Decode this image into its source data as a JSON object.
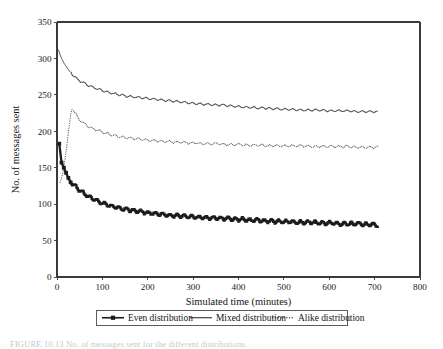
{
  "chart_data": {
    "type": "line",
    "title": "",
    "xlabel": "Simulated time (minutes)",
    "ylabel": "No. of messages sent",
    "xlim": [
      0,
      800
    ],
    "ylim": [
      0,
      350
    ],
    "xticks": [
      0,
      100,
      200,
      300,
      400,
      500,
      600,
      700,
      800
    ],
    "yticks": [
      0,
      50,
      100,
      150,
      200,
      250,
      300,
      350
    ],
    "grid": false,
    "legend_position": "below-axis",
    "series": [
      {
        "name": "Even distribution",
        "style": "solid-thick-markers",
        "marker": "square",
        "color": "#1c1c1c",
        "x": [
          5,
          10,
          15,
          20,
          25,
          30,
          35,
          40,
          50,
          60,
          70,
          80,
          90,
          100,
          110,
          120,
          130,
          140,
          150,
          160,
          170,
          180,
          190,
          200,
          215,
          230,
          245,
          260,
          275,
          290,
          305,
          320,
          335,
          350,
          365,
          380,
          395,
          410,
          425,
          440,
          455,
          470,
          485,
          500,
          515,
          530,
          545,
          560,
          575,
          590,
          605,
          620,
          635,
          650,
          665,
          680,
          695,
          708
        ],
        "y": [
          183,
          157,
          150,
          143,
          136,
          130,
          127,
          124,
          119,
          114,
          110,
          107,
          104,
          101,
          99,
          97,
          96,
          94,
          93,
          92,
          91,
          90,
          89,
          88,
          87,
          86,
          85,
          84,
          84,
          83,
          82,
          82,
          81,
          81,
          80,
          80,
          79,
          79,
          78,
          78,
          77,
          77,
          76,
          76,
          76,
          75,
          75,
          75,
          74,
          74,
          74,
          73,
          73,
          73,
          73,
          72,
          72,
          71
        ]
      },
      {
        "name": "Mixed distribution",
        "style": "solid-thin",
        "color": "#1c1c1c",
        "x": [
          3,
          8,
          14,
          20,
          26,
          32,
          38,
          45,
          52,
          60,
          68,
          76,
          85,
          95,
          105,
          115,
          128,
          140,
          155,
          170,
          185,
          200,
          215,
          230,
          245,
          260,
          275,
          290,
          305,
          320,
          335,
          350,
          365,
          380,
          395,
          410,
          425,
          440,
          455,
          470,
          485,
          500,
          520,
          540,
          560,
          580,
          600,
          620,
          640,
          660,
          680,
          700,
          708
        ],
        "y": [
          312,
          303,
          295,
          289,
          284,
          279,
          275,
          271,
          268,
          266,
          263,
          261,
          259,
          257,
          255,
          253,
          251,
          250,
          248,
          247,
          246,
          245,
          244,
          243,
          242,
          241,
          240,
          239,
          238,
          237,
          237,
          236,
          236,
          235,
          234,
          233,
          233,
          232,
          232,
          231,
          231,
          230,
          230,
          229,
          229,
          229,
          228,
          228,
          228,
          227,
          227,
          227,
          226
        ]
      },
      {
        "name": "Alike distribution",
        "style": "dotted-thin",
        "color": "#1c1c1c",
        "x": [
          6,
          10,
          14,
          18,
          22,
          26,
          30,
          33,
          36,
          40,
          45,
          52,
          60,
          68,
          76,
          85,
          95,
          105,
          115,
          128,
          140,
          155,
          170,
          185,
          200,
          215,
          230,
          245,
          260,
          275,
          290,
          305,
          320,
          335,
          350,
          365,
          380,
          395,
          410,
          425,
          440,
          455,
          470,
          485,
          500,
          520,
          540,
          560,
          580,
          600,
          620,
          640,
          660,
          680,
          700,
          708
        ],
        "y": [
          129,
          135,
          147,
          163,
          182,
          203,
          222,
          231,
          229,
          224,
          219,
          214,
          210,
          207,
          204,
          202,
          200,
          198,
          196,
          194,
          192,
          191,
          190,
          189,
          188,
          187,
          186,
          186,
          185,
          185,
          184,
          184,
          183,
          183,
          183,
          182,
          182,
          182,
          181,
          181,
          181,
          181,
          180,
          180,
          180,
          180,
          180,
          179,
          179,
          179,
          179,
          179,
          178,
          178,
          178,
          178
        ]
      }
    ]
  },
  "axes": {
    "xlabel": "Simulated time (minutes)",
    "ylabel": "No. of messages sent",
    "xticklabels": [
      "0",
      "100",
      "200",
      "300",
      "400",
      "500",
      "600",
      "700",
      "800"
    ],
    "yticklabels": [
      "0",
      "50",
      "100",
      "150",
      "200",
      "250",
      "300",
      "350"
    ]
  },
  "legend": {
    "items": [
      {
        "label": "Even distribution",
        "style": "solid-thick-marker"
      },
      {
        "label": "Mixed distribution",
        "style": "solid-thin"
      },
      {
        "label": "Alike distribution",
        "style": "dotted-thin"
      }
    ]
  },
  "caption": {
    "prefix": "FIGURE 10.13",
    "text": "FIGURE 10.13   No. of messages sent for the different distributions."
  }
}
